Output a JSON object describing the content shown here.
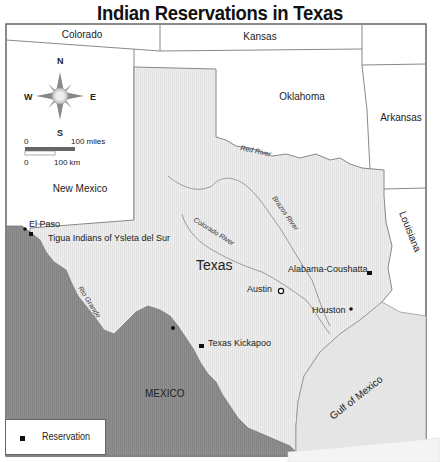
{
  "title": "Indian Reservations in Texas",
  "map": {
    "states": {
      "colorado": "Colorado",
      "kansas": "Kansas",
      "oklahoma": "Oklahoma",
      "arkansas": "Arkansas",
      "new_mexico": "New Mexico",
      "louisiana": "Louisiana",
      "texas": "Texas"
    },
    "countries": {
      "mexico": "MEXICO"
    },
    "water": {
      "gulf": "Gulf of Mexico"
    },
    "rivers": {
      "red": "Red River",
      "brazos": "Brazos River",
      "colorado": "Colorado River",
      "rio_grande": "Rio Grande"
    },
    "cities": {
      "el_paso": "El Paso",
      "austin": "Austin",
      "houston": "Houston"
    },
    "reservations": [
      {
        "name": "Tigua Indians of Ysleta del Sur"
      },
      {
        "name": "Alabama-Coushatta"
      },
      {
        "name": "Texas Kickapoo"
      }
    ],
    "compass": {
      "n": "N",
      "s": "S",
      "e": "E",
      "w": "W"
    },
    "scale": {
      "miles_zero": "0",
      "miles_label": "100 miles",
      "km_zero": "0",
      "km_label": "100 km"
    }
  },
  "legend": {
    "reservation": "Reservation"
  },
  "colors": {
    "texas_fill": "#ececec",
    "mexico_fill": "#8c8c8c",
    "gulf_fill": "#e4e4e4",
    "border": "#777777"
  }
}
